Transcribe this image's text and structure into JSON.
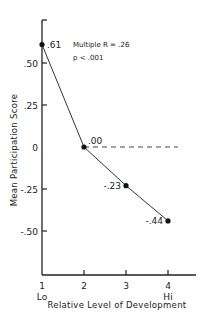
{
  "chart_data": {
    "type": "line",
    "title": "",
    "xlabel": "Relative Level of Development",
    "ylabel": "Mean Participation Score",
    "x": [
      1,
      2,
      3,
      4
    ],
    "x_tick_labels": [
      "1",
      "2",
      "3",
      "4"
    ],
    "x_tick_sublabels": [
      "Lo",
      "",
      "",
      "Hi"
    ],
    "y_ticks": [
      0.5,
      0.25,
      0,
      -0.25,
      -0.5
    ],
    "y_tick_labels": [
      ".50",
      ".25",
      "0",
      "-.25",
      "-.50"
    ],
    "xlim": [
      1,
      4.6
    ],
    "ylim": [
      -0.75,
      0.72
    ],
    "series": [
      {
        "name": "Mean Participation Score",
        "values": [
          0.61,
          0.0,
          -0.23,
          -0.44
        ],
        "data_labels": [
          ".61",
          ".00",
          "-.23",
          "-.44"
        ]
      }
    ],
    "reference_line": {
      "y": 0,
      "style": "dashed"
    },
    "annotations": [
      "Multiple R = .26",
      "p < .001"
    ],
    "grid": false,
    "legend": "none"
  }
}
